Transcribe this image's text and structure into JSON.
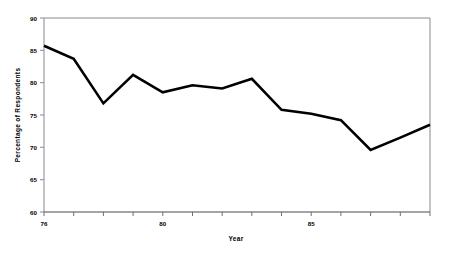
{
  "chart_data": {
    "type": "line",
    "title": "",
    "xlabel": "Year",
    "ylabel": "Percentage of Respondents",
    "xlim": [
      76,
      89
    ],
    "ylim": [
      60,
      90
    ],
    "grid": false,
    "legend": false,
    "x": [
      76,
      77,
      78,
      79,
      80,
      81,
      82,
      83,
      84,
      85,
      86,
      87,
      88,
      89
    ],
    "values": [
      85.7,
      83.7,
      76.8,
      81.2,
      78.5,
      79.6,
      79.1,
      80.6,
      75.8,
      75.2,
      74.2,
      69.6,
      71.5,
      73.5
    ],
    "xticks": [
      76,
      77,
      78,
      79,
      80,
      81,
      82,
      83,
      84,
      85,
      86,
      87,
      88,
      89
    ],
    "xtick_labels": [
      "76",
      "",
      "",
      "",
      "80",
      "",
      "",
      "",
      "",
      "85",
      "",
      "",
      "",
      ""
    ],
    "yticks": [
      60,
      65,
      70,
      75,
      80,
      85,
      90
    ],
    "ytick_labels": [
      "60",
      "65",
      "70",
      "75",
      "80",
      "85",
      "90"
    ],
    "line_color": "#000000",
    "line_width": 2.6,
    "frame_color": "#808080"
  },
  "axes": {
    "x_title": "Year",
    "y_title": "Percentage of Respondents"
  },
  "ytick_text": {
    "t90": "90",
    "t85": "85",
    "t80": "80",
    "t75": "75",
    "t70": "70",
    "t65": "65",
    "t60": "60"
  },
  "xtick_text": {
    "t76": "76",
    "t80": "80",
    "t85": "85"
  }
}
